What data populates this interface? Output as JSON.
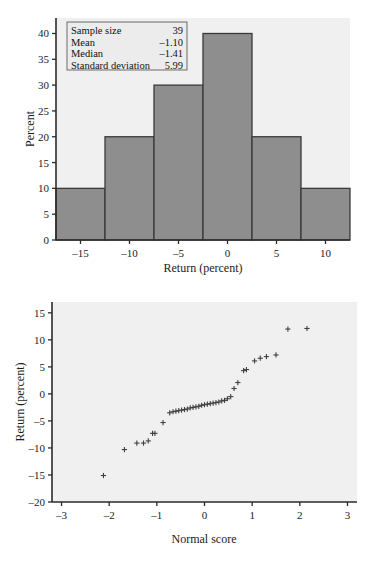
{
  "page": {
    "background": "#ffffff",
    "panel_background": "#f0f0f0",
    "bar_fill": "#8e8e8e",
    "bar_stroke": "#3a3a3a",
    "marker_color": "#3f3f3f"
  },
  "histogram": {
    "stats_box": {
      "rows": [
        {
          "label": "Sample size",
          "value": "39"
        },
        {
          "label": "Mean",
          "value": "–1.10"
        },
        {
          "label": "Median",
          "value": "–1.41"
        },
        {
          "label": "Standard deviation",
          "value": "5.99"
        }
      ]
    }
  },
  "chart_data": [
    {
      "type": "bar",
      "title": "",
      "xlabel": "Return (percent)",
      "ylabel": "Percent",
      "categories": [
        "–17.5 to –12.5",
        "–12.5 to –7.5",
        "–7.5 to –2.5",
        "–2.5 to 2.5",
        "2.5 to 7.5",
        "7.5 to 12.5"
      ],
      "bin_edges": [
        -17.5,
        -12.5,
        -7.5,
        -2.5,
        2.5,
        7.5,
        12.5
      ],
      "values": [
        10,
        20,
        30,
        40,
        20,
        10
      ],
      "xticks": [
        "–15",
        "–10",
        "–5",
        "0",
        "5",
        "10"
      ],
      "xtick_values": [
        -15,
        -10,
        -5,
        0,
        5,
        10
      ],
      "yticks": [
        "0",
        "5",
        "10",
        "15",
        "20",
        "25",
        "30",
        "35",
        "40"
      ],
      "ytick_values": [
        0,
        5,
        10,
        15,
        20,
        25,
        30,
        35,
        40
      ],
      "xlim": [
        -17.5,
        12.5
      ],
      "ylim": [
        0,
        43
      ],
      "grid": false,
      "legend": "none"
    },
    {
      "type": "scatter",
      "title": "",
      "xlabel": "Normal score",
      "ylabel": "Return (percent)",
      "xticks": [
        "–3",
        "–2",
        "–1",
        "0",
        "1",
        "2",
        "3"
      ],
      "xtick_values": [
        -3,
        -2,
        -1,
        0,
        1,
        2,
        3
      ],
      "yticks": [
        "–20",
        "–15",
        "–10",
        "–5",
        "0",
        "5",
        "10",
        "15"
      ],
      "ytick_values": [
        -20,
        -15,
        -10,
        -5,
        0,
        5,
        10,
        15
      ],
      "xlim": [
        -3.2,
        3.2
      ],
      "ylim": [
        -20,
        17
      ],
      "grid": false,
      "legend": "none",
      "marker": "plus",
      "points": [
        {
          "x": -2.12,
          "y": -15.1
        },
        {
          "x": -1.68,
          "y": -10.3
        },
        {
          "x": -1.42,
          "y": -9.1
        },
        {
          "x": -1.28,
          "y": -9.1
        },
        {
          "x": -1.18,
          "y": -8.7
        },
        {
          "x": -1.09,
          "y": -7.3
        },
        {
          "x": -1.04,
          "y": -7.3
        },
        {
          "x": -0.87,
          "y": -5.3
        },
        {
          "x": -0.73,
          "y": -3.5
        },
        {
          "x": -0.66,
          "y": -3.3
        },
        {
          "x": -0.6,
          "y": -3.2
        },
        {
          "x": -0.54,
          "y": -3.1
        },
        {
          "x": -0.48,
          "y": -3.0
        },
        {
          "x": -0.42,
          "y": -2.9
        },
        {
          "x": -0.36,
          "y": -2.8
        },
        {
          "x": -0.3,
          "y": -2.6
        },
        {
          "x": -0.24,
          "y": -2.5
        },
        {
          "x": -0.18,
          "y": -2.4
        },
        {
          "x": -0.12,
          "y": -2.3
        },
        {
          "x": -0.06,
          "y": -2.1
        },
        {
          "x": 0.0,
          "y": -2.0
        },
        {
          "x": 0.06,
          "y": -1.9
        },
        {
          "x": 0.12,
          "y": -1.8
        },
        {
          "x": 0.18,
          "y": -1.7
        },
        {
          "x": 0.24,
          "y": -1.6
        },
        {
          "x": 0.3,
          "y": -1.5
        },
        {
          "x": 0.36,
          "y": -1.3
        },
        {
          "x": 0.42,
          "y": -1.2
        },
        {
          "x": 0.48,
          "y": -0.9
        },
        {
          "x": 0.55,
          "y": -0.5
        },
        {
          "x": 0.62,
          "y": 1.0
        },
        {
          "x": 0.7,
          "y": 2.1
        },
        {
          "x": 0.82,
          "y": 4.3
        },
        {
          "x": 0.88,
          "y": 4.5
        },
        {
          "x": 1.05,
          "y": 6.1
        },
        {
          "x": 1.17,
          "y": 6.6
        },
        {
          "x": 1.3,
          "y": 6.9
        },
        {
          "x": 1.5,
          "y": 7.2
        },
        {
          "x": 1.75,
          "y": 12.0
        },
        {
          "x": 2.15,
          "y": 12.1
        }
      ]
    }
  ]
}
